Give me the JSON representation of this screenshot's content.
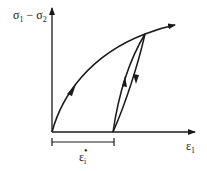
{
  "diagram": {
    "type": "stress-strain loading-unloading diagram",
    "y_axis": {
      "label_main": "σ",
      "label_sub1": "1",
      "label_minus": " − ",
      "label_main2": "σ",
      "label_sub2": "2"
    },
    "x_axis": {
      "label_main": "ε",
      "label_sub": "1"
    },
    "dimension": {
      "label_main": "ε",
      "label_sub": "i",
      "label_sup": "•"
    },
    "colors": {
      "stroke": "#1a1a1a",
      "background": "#ffffff"
    }
  }
}
